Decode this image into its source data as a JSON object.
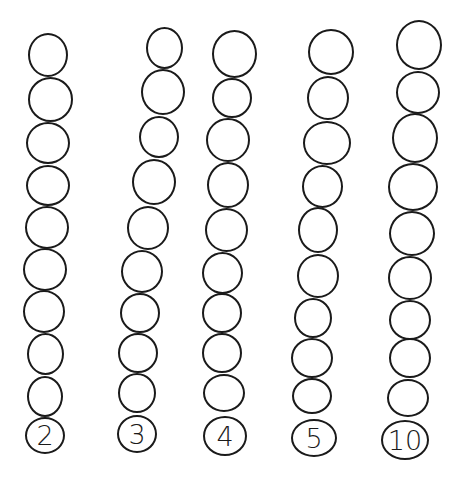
{
  "worksheet": {
    "columns": [
      {
        "label": "2",
        "beads": [
          {
            "x": 48,
            "y": 55,
            "w": 40,
            "h": 44
          },
          {
            "x": 50,
            "y": 99,
            "w": 45,
            "h": 45
          },
          {
            "x": 48,
            "y": 143,
            "w": 44,
            "h": 42
          },
          {
            "x": 48,
            "y": 185,
            "w": 44,
            "h": 41
          },
          {
            "x": 47,
            "y": 227,
            "w": 44,
            "h": 43
          },
          {
            "x": 45,
            "y": 269,
            "w": 44,
            "h": 43
          },
          {
            "x": 44,
            "y": 311,
            "w": 42,
            "h": 43
          },
          {
            "x": 45,
            "y": 354,
            "w": 37,
            "h": 42
          },
          {
            "x": 45,
            "y": 396,
            "w": 36,
            "h": 41
          }
        ],
        "label_pos": {
          "x": 45,
          "y": 435,
          "w": 40,
          "h": 37
        }
      },
      {
        "label": "3",
        "beads": [
          {
            "x": 164,
            "y": 48,
            "w": 37,
            "h": 42
          },
          {
            "x": 163,
            "y": 92,
            "w": 44,
            "h": 46
          },
          {
            "x": 159,
            "y": 137,
            "w": 40,
            "h": 42
          },
          {
            "x": 154,
            "y": 182,
            "w": 44,
            "h": 46
          },
          {
            "x": 148,
            "y": 228,
            "w": 42,
            "h": 44
          },
          {
            "x": 142,
            "y": 271,
            "w": 42,
            "h": 43
          },
          {
            "x": 140,
            "y": 313,
            "w": 40,
            "h": 40
          },
          {
            "x": 138,
            "y": 353,
            "w": 40,
            "h": 40
          },
          {
            "x": 137,
            "y": 393,
            "w": 38,
            "h": 40
          }
        ],
        "label_pos": {
          "x": 137,
          "y": 434,
          "w": 40,
          "h": 38
        }
      },
      {
        "label": "4",
        "beads": [
          {
            "x": 234,
            "y": 54,
            "w": 45,
            "h": 48
          },
          {
            "x": 232,
            "y": 98,
            "w": 40,
            "h": 40
          },
          {
            "x": 228,
            "y": 140,
            "w": 44,
            "h": 44
          },
          {
            "x": 228,
            "y": 185,
            "w": 42,
            "h": 46
          },
          {
            "x": 226,
            "y": 230,
            "w": 43,
            "h": 44
          },
          {
            "x": 222,
            "y": 273,
            "w": 41,
            "h": 42
          },
          {
            "x": 222,
            "y": 313,
            "w": 40,
            "h": 40
          },
          {
            "x": 222,
            "y": 353,
            "w": 40,
            "h": 40
          },
          {
            "x": 224,
            "y": 393,
            "w": 42,
            "h": 38
          }
        ],
        "label_pos": {
          "x": 225,
          "y": 436,
          "w": 44,
          "h": 40
        }
      },
      {
        "label": "5",
        "beads": [
          {
            "x": 331,
            "y": 52,
            "w": 46,
            "h": 46
          },
          {
            "x": 328,
            "y": 98,
            "w": 42,
            "h": 44
          },
          {
            "x": 327,
            "y": 143,
            "w": 48,
            "h": 44
          },
          {
            "x": 322,
            "y": 186,
            "w": 41,
            "h": 43
          },
          {
            "x": 318,
            "y": 230,
            "w": 40,
            "h": 46
          },
          {
            "x": 318,
            "y": 276,
            "w": 42,
            "h": 44
          },
          {
            "x": 313,
            "y": 318,
            "w": 38,
            "h": 40
          },
          {
            "x": 312,
            "y": 358,
            "w": 42,
            "h": 40
          },
          {
            "x": 312,
            "y": 396,
            "w": 40,
            "h": 36
          }
        ],
        "label_pos": {
          "x": 314,
          "y": 438,
          "w": 46,
          "h": 38
        }
      },
      {
        "label": "10",
        "beads": [
          {
            "x": 419,
            "y": 45,
            "w": 46,
            "h": 50
          },
          {
            "x": 418,
            "y": 92,
            "w": 44,
            "h": 43
          },
          {
            "x": 415,
            "y": 138,
            "w": 46,
            "h": 50
          },
          {
            "x": 413,
            "y": 187,
            "w": 50,
            "h": 48
          },
          {
            "x": 412,
            "y": 233,
            "w": 46,
            "h": 45
          },
          {
            "x": 410,
            "y": 278,
            "w": 44,
            "h": 44
          },
          {
            "x": 410,
            "y": 320,
            "w": 42,
            "h": 40
          },
          {
            "x": 410,
            "y": 358,
            "w": 42,
            "h": 40
          },
          {
            "x": 408,
            "y": 398,
            "w": 42,
            "h": 38
          }
        ],
        "label_pos": {
          "x": 405,
          "y": 440,
          "w": 48,
          "h": 40
        }
      }
    ]
  }
}
